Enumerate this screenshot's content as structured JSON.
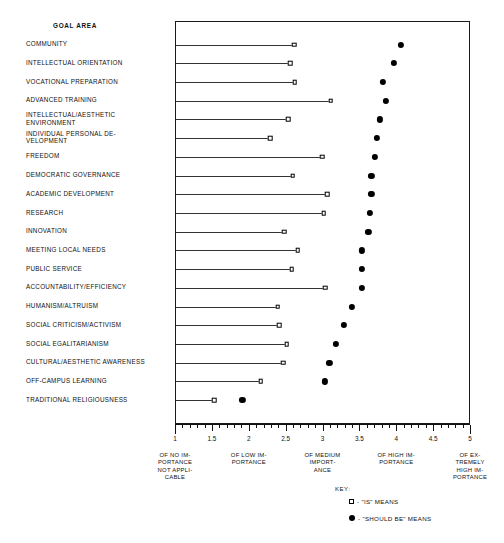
{
  "header": {
    "goal_area_title": "GOAL AREA"
  },
  "key": {
    "title": "KEY:",
    "items": [
      {
        "glyph": "open-square",
        "label": "- \"IS\" MEANS"
      },
      {
        "glyph": "filled-circle",
        "label": "- \"SHOULD BE\" MEANS"
      }
    ]
  },
  "axis": {
    "tick_labels": [
      "1",
      "1.5",
      "2",
      "2.5",
      "3",
      "3.5",
      "4",
      "4.5",
      "5"
    ],
    "anchors": [
      {
        "value": 1,
        "text": "OF NO IM-\nPORTANCE\nNOT APPLI-\nCABLE"
      },
      {
        "value": 2,
        "text": "OF LOW IM-\nPORTANCE"
      },
      {
        "value": 3,
        "text": "OF MEDIUM\nIMPORT-\nANCE"
      },
      {
        "value": 4,
        "text": "OF HIGH IM-\nPORTANCE"
      },
      {
        "value": 5,
        "text": "OF EX-\nTREMELY\nHIGH IM-\nPORTANCE"
      }
    ]
  },
  "chart_data": {
    "type": "scatter",
    "title": "",
    "xlabel": "",
    "ylabel": "GOAL AREA",
    "xlim": [
      1,
      5
    ],
    "grid": false,
    "legend_position": "bottom-right",
    "categories": [
      "COMMUNITY",
      "INTELLECTUAL ORIENTATION",
      "VOCATIONAL PREPARATION",
      "ADVANCED TRAINING",
      "INTELLECTUAL/AESTHETIC\nENVIRONMENT",
      "INDIVIDUAL PERSONAL DE-\nVELOPMENT",
      "FREEDOM",
      "DEMOCRATIC GOVERNANCE",
      "ACADEMIC DEVELOPMENT",
      "RESEARCH",
      "INNOVATION",
      "MEETING LOCAL NEEDS",
      "PUBLIC SERVICE",
      "ACCOUNTABILITY/EFFICIENCY",
      "HUMANISM/ALTRUISM",
      "SOCIAL CRITICISM/ACTIVISM",
      "SOCIAL EGALITARIANISM",
      "CULTURAL/AESTHETIC AWARENESS",
      "OFF-CAMPUS LEARNING",
      "TRADITIONAL RELIGIOUSNESS"
    ],
    "series": [
      {
        "name": "\"IS\" MEANS",
        "marker": "open-square",
        "values": [
          2.6,
          2.55,
          2.61,
          3.1,
          2.52,
          2.28,
          2.98,
          2.58,
          3.05,
          3.0,
          2.47,
          2.65,
          2.57,
          3.02,
          2.38,
          2.4,
          2.5,
          2.45,
          2.15,
          1.52
        ]
      },
      {
        "name": "\"SHOULD BE\" MEANS",
        "marker": "filled-circle",
        "values": [
          4.05,
          3.95,
          3.8,
          3.85,
          3.76,
          3.72,
          3.7,
          3.65,
          3.65,
          3.63,
          3.61,
          3.52,
          3.52,
          3.52,
          3.38,
          3.28,
          3.17,
          3.08,
          3.02,
          1.9
        ]
      }
    ]
  }
}
